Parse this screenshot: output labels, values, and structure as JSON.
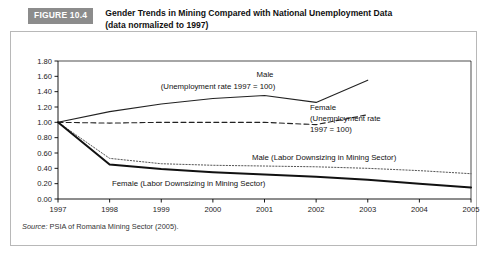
{
  "figure": {
    "badge": "FIGURE 10.4",
    "title_line1": "Gender Trends in Mining Compared with National Unemployment Data",
    "title_line2": "(data normalized to 1997)",
    "source_label": "Source:",
    "source_text": " PSIA of Romania Mining Sector (2005)."
  },
  "colors": {
    "badge_bg": "#8c8c8c",
    "badge_text": "#ffffff",
    "axis": "#000000",
    "frame": "#b8b8b8",
    "line": "#222222"
  },
  "annotations": {
    "male_unemp_l1": "Male",
    "male_unemp_l2": "(Unemployment rate 1997 = 100)",
    "female_unemp_l1": "Female",
    "female_unemp_l2": "(Unemployment rate",
    "female_unemp_l3": "1997 = 100)",
    "male_downsizing": "Male (Labor Downsizing in Mining Sector)",
    "female_downsizing": "Female (Labor Downsizing in Mining Sector)"
  },
  "chart_data": {
    "type": "line",
    "title": "Gender Trends in Mining Compared with National Unemployment Data (data normalized to 1997)",
    "xlabel": "",
    "ylabel": "",
    "x": [
      "1997",
      "1998",
      "1999",
      "2000",
      "2001",
      "2002",
      "2003",
      "2004",
      "2005"
    ],
    "ylim": [
      0.0,
      1.8
    ],
    "yticks": [
      "0.00",
      "0.20",
      "0.40",
      "0.60",
      "0.80",
      "1.00",
      "1.20",
      "1.40",
      "1.60",
      "1.80"
    ],
    "grid": false,
    "legend": "annotations-inline",
    "series": [
      {
        "name": "Male (Unemployment rate 1997 = 100)",
        "style": "solid",
        "values": [
          1.0,
          1.14,
          1.24,
          1.31,
          1.35,
          1.26,
          1.55,
          null,
          null
        ]
      },
      {
        "name": "Female (Unemployment rate 1997 = 100)",
        "style": "dashed",
        "values": [
          1.0,
          0.99,
          1.0,
          1.0,
          1.0,
          0.97,
          1.1,
          null,
          null
        ]
      },
      {
        "name": "Male (Labor Downsizing in Mining Sector)",
        "style": "dotted",
        "values": [
          1.0,
          0.53,
          0.46,
          0.44,
          0.43,
          0.42,
          0.4,
          0.37,
          0.33
        ]
      },
      {
        "name": "Female (Labor Downsizing in Mining Sector)",
        "style": "bold-solid",
        "values": [
          1.0,
          0.45,
          0.39,
          0.35,
          0.32,
          0.29,
          0.25,
          0.2,
          0.15
        ]
      }
    ]
  }
}
